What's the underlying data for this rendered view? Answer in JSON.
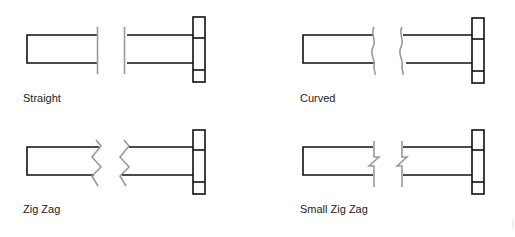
{
  "diagram": {
    "colors": {
      "outline": "#111111",
      "break_line": "#9a9a9a",
      "label": "#222222"
    },
    "panels": [
      {
        "id": "straight",
        "label": "Straight",
        "break_style": "straight"
      },
      {
        "id": "curved",
        "label": "Curved",
        "break_style": "curved"
      },
      {
        "id": "zig-zag",
        "label": "Zig Zag",
        "break_style": "zig-zag"
      },
      {
        "id": "small-zig-zag",
        "label": "Small Zig Zag",
        "break_style": "small-zig-zag"
      }
    ]
  }
}
